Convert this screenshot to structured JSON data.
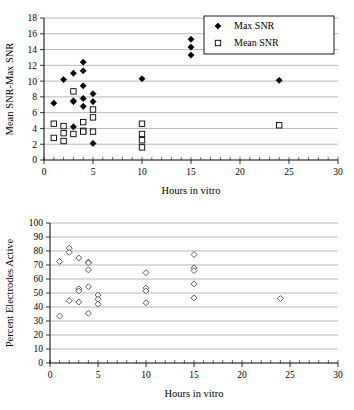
{
  "figure": {
    "charts": [
      {
        "id": "top",
        "xlabel": "Hours in vitro",
        "ylabel": "Mean SNR-Max SNR",
        "xlim": [
          0,
          30
        ],
        "ylim": [
          0,
          18
        ],
        "xticks": [
          0,
          5,
          10,
          15,
          20,
          25,
          30
        ],
        "yticks": [
          0,
          2,
          4,
          6,
          8,
          10,
          12,
          14,
          16,
          18
        ],
        "xtick_labels": [
          "0",
          "5",
          "10",
          "15",
          "20",
          "25",
          "30"
        ],
        "ytick_labels": [
          "0",
          "2",
          "4",
          "6",
          "8",
          "10",
          "12",
          "14",
          "16",
          "18"
        ],
        "minor_x_step": 1,
        "grid": "horizontal",
        "legend": {
          "position": "top-right",
          "entries": [
            {
              "label": "Max SNR",
              "marker": "filled-diamond"
            },
            {
              "label": "Mean SNR",
              "marker": "open-square"
            }
          ]
        }
      },
      {
        "id": "bottom",
        "xlabel": "Hours in vitro",
        "ylabel": "Percent Electrodes Active",
        "xlim": [
          0,
          30
        ],
        "ylim": [
          0,
          100
        ],
        "xticks": [
          0,
          5,
          10,
          15,
          20,
          25,
          30
        ],
        "yticks": [
          0,
          10,
          20,
          30,
          40,
          50,
          60,
          70,
          80,
          90,
          100
        ],
        "xtick_labels": [
          "0",
          "5",
          "10",
          "15",
          "20",
          "25",
          "30"
        ],
        "ytick_labels": [
          "0",
          "10",
          "20",
          "30",
          "40",
          "50",
          "60",
          "70",
          "80",
          "90",
          "100"
        ],
        "minor_x_step": 1,
        "grid": "horizontal",
        "legend": null
      }
    ]
  },
  "chart_data": [
    {
      "type": "scatter",
      "title": "",
      "xlabel": "Hours in vitro",
      "ylabel": "Mean SNR-Max SNR",
      "xlim": [
        0,
        30
      ],
      "ylim": [
        0,
        18
      ],
      "grid": "horizontal gridlines only",
      "legend_position": "top-right",
      "series": [
        {
          "name": "Max SNR",
          "marker": "filled-diamond",
          "color": "#000000",
          "points": [
            [
              1,
              7.2
            ],
            [
              2,
              10.2
            ],
            [
              3,
              11.0
            ],
            [
              3,
              7.5
            ],
            [
              3,
              7.4
            ],
            [
              4,
              12.4
            ],
            [
              4,
              11.3
            ],
            [
              4,
              9.4
            ],
            [
              4,
              7.8
            ],
            [
              4,
              6.8
            ],
            [
              5,
              8.4
            ],
            [
              5,
              7.4
            ],
            [
              5,
              2.1
            ],
            [
              3,
              4.2
            ],
            [
              10,
              10.3
            ],
            [
              15,
              15.3
            ],
            [
              15,
              14.3
            ],
            [
              15,
              13.3
            ],
            [
              24,
              10.1
            ]
          ]
        },
        {
          "name": "Mean SNR",
          "marker": "open-square",
          "color": "#000000",
          "points": [
            [
              1,
              4.6
            ],
            [
              1,
              2.8
            ],
            [
              2,
              4.3
            ],
            [
              2,
              3.4
            ],
            [
              2,
              2.4
            ],
            [
              3,
              8.7
            ],
            [
              3,
              3.3
            ],
            [
              4,
              4.8
            ],
            [
              4,
              3.7
            ],
            [
              4,
              3.6
            ],
            [
              5,
              6.4
            ],
            [
              5,
              5.4
            ],
            [
              5,
              3.6
            ],
            [
              10,
              4.6
            ],
            [
              10,
              3.3
            ],
            [
              10,
              2.5
            ],
            [
              10,
              1.6
            ],
            [
              24,
              4.4
            ]
          ]
        }
      ]
    },
    {
      "type": "scatter",
      "title": "",
      "xlabel": "Hours in vitro",
      "ylabel": "Percent Electrodes Active",
      "xlim": [
        0,
        30
      ],
      "ylim": [
        0,
        100
      ],
      "grid": "horizontal gridlines only",
      "legend_position": "none",
      "series": [
        {
          "name": "Percent Electrodes Active",
          "marker": "open-diamond",
          "color": "#4a4a4a",
          "points": [
            [
              1,
              72.5
            ],
            [
              1,
              33.5
            ],
            [
              2,
              82.0
            ],
            [
              2,
              79.0
            ],
            [
              2,
              44.5
            ],
            [
              3,
              75.0
            ],
            [
              3,
              53.0
            ],
            [
              3,
              51.5
            ],
            [
              3,
              43.5
            ],
            [
              4,
              72.0
            ],
            [
              4,
              71.5
            ],
            [
              4,
              66.5
            ],
            [
              4,
              54.5
            ],
            [
              4,
              35.5
            ],
            [
              5,
              48.5
            ],
            [
              5,
              45.5
            ],
            [
              5,
              42.0
            ],
            [
              10,
              64.5
            ],
            [
              10,
              53.5
            ],
            [
              10,
              51.5
            ],
            [
              10,
              43.0
            ],
            [
              15,
              77.5
            ],
            [
              15,
              68.0
            ],
            [
              15,
              66.0
            ],
            [
              15,
              56.5
            ],
            [
              15,
              46.5
            ],
            [
              24,
              46.0
            ]
          ]
        }
      ]
    }
  ]
}
